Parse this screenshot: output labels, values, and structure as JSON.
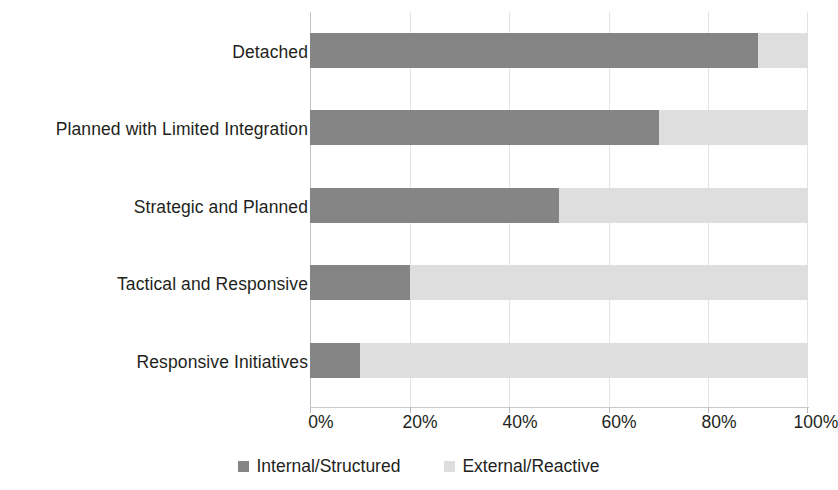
{
  "chart_data": {
    "type": "bar",
    "subtype": "stacked-horizontal-100-percent",
    "title": "",
    "subtitle": "",
    "xlabel": "",
    "ylabel": "",
    "orientation": "horizontal",
    "stacked": true,
    "grid": true,
    "xlim": [
      0,
      100
    ],
    "xticks": [
      0,
      20,
      40,
      60,
      80,
      100
    ],
    "xtick_labels": [
      "0%",
      "20%",
      "40%",
      "60%",
      "80%",
      "100%"
    ],
    "legend_position": "bottom",
    "categories": [
      "Detached",
      "Planned with Limited Integration",
      "Strategic and Planned",
      "Tactical and Responsive",
      "Responsive Initiatives"
    ],
    "series": [
      {
        "name": "Internal/Structured",
        "color": "#858585",
        "values": [
          90,
          70,
          50,
          20,
          10
        ]
      },
      {
        "name": "External/Reactive",
        "color": "#dedede",
        "values": [
          10,
          30,
          50,
          80,
          90
        ]
      }
    ]
  },
  "axis": {
    "tick_labels": [
      "0%",
      "20%",
      "40%",
      "60%",
      "80%",
      "100%"
    ]
  },
  "categories": [
    {
      "label": "Detached"
    },
    {
      "label": "Planned with Limited Integration"
    },
    {
      "label": "Strategic and Planned"
    },
    {
      "label": "Tactical and Responsive"
    },
    {
      "label": "Responsive Initiatives"
    }
  ],
  "legend": {
    "items": [
      {
        "label": "Internal/Structured",
        "color": "#858585"
      },
      {
        "label": "External/Reactive",
        "color": "#dedede"
      }
    ]
  },
  "colors": {
    "internal_structured": "#858585",
    "external_reactive": "#dedede",
    "gridline": "#e4e4e4",
    "text": "#231f20",
    "background": "#ffffff"
  }
}
